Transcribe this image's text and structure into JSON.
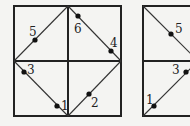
{
  "figures": [
    {
      "id": "left-square",
      "points": [
        {
          "label": "1",
          "x": 56,
          "y": 106
        },
        {
          "label": "2",
          "x": 89,
          "y": 95
        },
        {
          "label": "3",
          "x": 24,
          "y": 72
        },
        {
          "label": "4",
          "x": 111,
          "y": 51
        },
        {
          "label": "5",
          "x": 35,
          "y": 40
        },
        {
          "label": "6",
          "x": 78,
          "y": 16
        }
      ]
    },
    {
      "id": "right-square-partial",
      "points": [
        {
          "label": "5",
          "x": 171,
          "y": 34
        },
        {
          "label": "3",
          "x": 186,
          "y": 72
        },
        {
          "label": "1",
          "x": 154,
          "y": 106
        }
      ]
    }
  ],
  "labels": {
    "l1": "1",
    "l2": "2",
    "l3": "3",
    "l4": "4",
    "l5": "5",
    "l6": "6",
    "r5": "5",
    "r3": "3",
    "r1": "1"
  }
}
